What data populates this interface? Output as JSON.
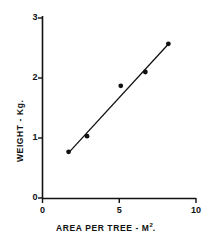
{
  "chart_data": {
    "type": "scatter",
    "title": "",
    "subtitle": "",
    "xlabel": "AREA PER TREE - M",
    "xlabel_superscript": "2",
    "xlabel_suffix": ".",
    "ylabel": "WEIGHT - Kg.",
    "xlim": [
      0,
      10
    ],
    "ylim": [
      0,
      3
    ],
    "xticks": [
      0,
      5,
      10
    ],
    "xtick_labels": [
      "0",
      "5",
      "10"
    ],
    "yticks": [
      0,
      1,
      2,
      3
    ],
    "ytick_labels": [
      "0",
      "1",
      "2",
      "3"
    ],
    "grid": false,
    "legend": null,
    "marker": "filled-circle",
    "marker_color": "#111111",
    "line_color": "#111111",
    "axis_color": "#111111",
    "background": "#ffffff",
    "points": [
      {
        "x": 1.7,
        "y": 0.77
      },
      {
        "x": 2.9,
        "y": 1.03
      },
      {
        "x": 5.1,
        "y": 1.87
      },
      {
        "x": 6.7,
        "y": 2.1
      },
      {
        "x": 8.2,
        "y": 2.57
      }
    ],
    "x": [
      1.7,
      2.9,
      5.1,
      6.7,
      8.2
    ],
    "values": [
      0.77,
      1.03,
      1.87,
      2.1,
      2.57
    ],
    "trendline": {
      "type": "linear-fit",
      "x_start": 1.65,
      "y_start": 0.74,
      "x_end": 8.25,
      "y_end": 2.58
    }
  },
  "figure": {
    "caption": ""
  }
}
